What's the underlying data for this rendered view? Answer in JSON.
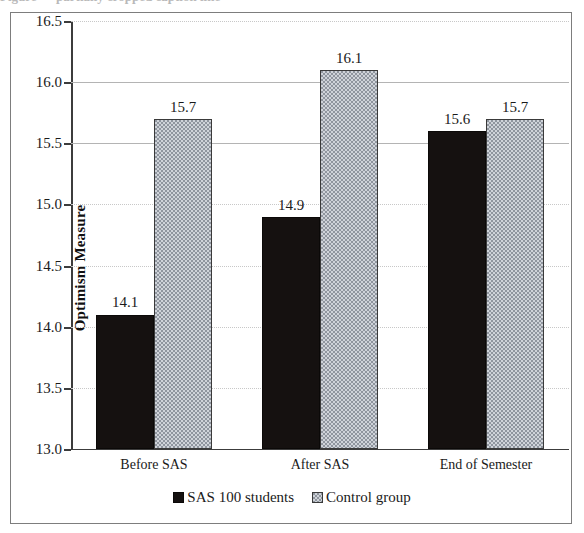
{
  "chart_data": {
    "type": "bar",
    "title": "",
    "xlabel": "",
    "ylabel": "Optimism Measure",
    "ylim": [
      13.0,
      16.5
    ],
    "ytick_labels": [
      "16.5",
      "16.0",
      "15.5",
      "15.0",
      "14.5",
      "14.0",
      "13.5",
      "13.0"
    ],
    "ytick_values": [
      16.5,
      16.0,
      15.5,
      15.0,
      14.5,
      14.0,
      13.5,
      13.0
    ],
    "grid": true,
    "legend_position": "bottom-center",
    "categories": [
      "Before SAS",
      "After SAS",
      "End of Semester"
    ],
    "series": [
      {
        "name": "SAS 100 students",
        "color": "#151110",
        "pattern": "solid",
        "values": [
          14.1,
          14.9,
          15.6
        ],
        "labels": [
          "14.1",
          "14.9",
          "15.6"
        ]
      },
      {
        "name": "Control group",
        "color": "#a9aeb6",
        "pattern": "checkered",
        "values": [
          15.7,
          16.1,
          15.7
        ],
        "labels": [
          "15.7",
          "16.1",
          "15.7"
        ]
      }
    ]
  },
  "legend": {
    "items": [
      {
        "label": "SAS 100 students",
        "swatch": "black-square-icon"
      },
      {
        "label": "Control group",
        "swatch": "gray-checkered-square-icon"
      }
    ]
  },
  "axis": {
    "y_title": "Optimism Measure"
  },
  "caption_ghost": "Figure — partially cropped caption line"
}
